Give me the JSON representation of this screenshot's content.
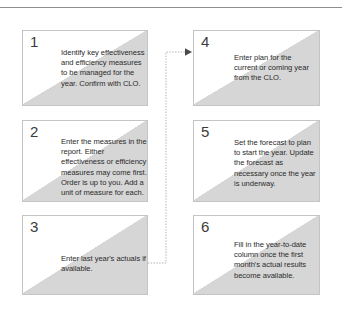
{
  "diagram": {
    "type": "flowchart",
    "title": "",
    "colors": {
      "box_fill": "#d6d6d6",
      "box_border": "#c4c4c4",
      "corner_wedge": "#ffffff",
      "text": "#2b2b2b",
      "number": "#3b3b3b",
      "rule": "#8e8e8e",
      "connector": "#b0b0b0"
    },
    "steps": [
      {
        "number": "1",
        "text": "Identify key effectiveness and efficiency measures to be managed for the year. Confirm with CLO."
      },
      {
        "number": "2",
        "text": "Enter the measures in the report. Either effectiveness or efficiency measures may come first. Order is up to you. Add a unit of measure for each."
      },
      {
        "number": "3",
        "text": "Enter last year's actuals if available."
      },
      {
        "number": "4",
        "text": "Enter plan for the current or coming year from the CLO."
      },
      {
        "number": "5",
        "text": "Set the forecast to plan to start the year. Update the forecast as necessary once the year is underway."
      },
      {
        "number": "6",
        "text": "Fill in the year-to-date column once the first month's actual results become available."
      }
    ],
    "connectors": [
      {
        "from": "3",
        "to": "4",
        "style": "dotted",
        "arrowhead": "filled-triangle-right"
      }
    ]
  }
}
